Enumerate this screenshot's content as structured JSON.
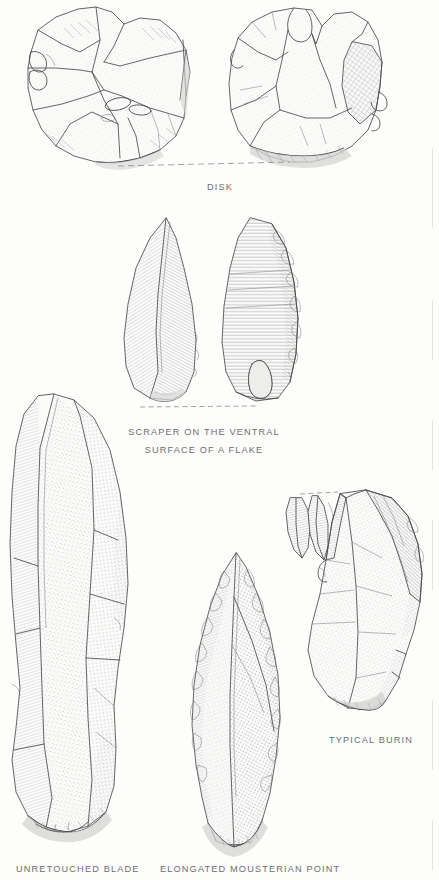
{
  "page": {
    "background_color": "#fdfdfc",
    "ink_color": "#4a4a4c",
    "caption_color": "#6e6e70",
    "width": 439,
    "height": 880
  },
  "figures": [
    {
      "id": "disk",
      "caption": "DISK",
      "views": 2,
      "view_labels": [
        "dorsal view",
        "ventral view"
      ],
      "baseline": "dashed",
      "technique": "stipple and fine hatch",
      "outline": "polygonal discoidal core with radial flake scars"
    },
    {
      "id": "scraper",
      "caption_line_1": "SCRAPER ON THE VENTRAL",
      "caption_line_2": "SURFACE OF A FLAKE",
      "views": 2,
      "view_labels": [
        "dorsal view",
        "ventral view"
      ],
      "baseline": "dashed",
      "technique": "diagonal hatch and horizontal ripple lines",
      "outline": "elongated ogival flake with retouched right edge"
    },
    {
      "id": "blade",
      "caption": "UNRETOUCHED BLADE",
      "views": 1,
      "baseline": "none",
      "technique": "fine stipple rows and parallel hatch",
      "outline": "long narrow blade with median ridge and striking platform at base"
    },
    {
      "id": "point",
      "caption": "ELONGATED MOUSTERIAN POINT",
      "views": 1,
      "baseline": "none",
      "technique": "stipple with hatched retouch scars along both edges",
      "outline": "elongated leaf point with central dorsal ridge and convergent tip"
    },
    {
      "id": "burin",
      "caption": "TYPICAL BURIN",
      "views": 1,
      "baseline": "dashed tick at burin facet",
      "technique": "stipple field with hatched burin facet",
      "outline": "angular flake with burin blow facet and detached burin spall shown separately"
    }
  ],
  "captions": {
    "disk": "DISK",
    "scraper_1": "SCRAPER ON THE VENTRAL",
    "scraper_2": "SURFACE OF A FLAKE",
    "burin": "TYPICAL BURIN",
    "blade": "UNRETOUCHED BLADE",
    "point": "ELONGATED MOUSTERIAN POINT"
  }
}
